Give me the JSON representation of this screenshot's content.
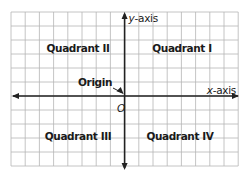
{
  "diagram": {
    "grid": {
      "columns": 16,
      "rows": 11,
      "origin_column": 8,
      "origin_row": 6
    },
    "colors": {
      "grid": "#b5b5b5",
      "axis": "#222222",
      "text": "#1a1a1a",
      "background": "#ffffff"
    },
    "axes": {
      "x": {
        "label_var": "x",
        "label_suffix": "-axis"
      },
      "y": {
        "label_var": "y",
        "label_suffix": "-axis"
      }
    },
    "origin": {
      "label": "Origin",
      "symbol": "O"
    },
    "quadrants": [
      {
        "id": "I",
        "label": "Quadrant I"
      },
      {
        "id": "II",
        "label": "Quadrant II"
      },
      {
        "id": "III",
        "label": "Quadrant III"
      },
      {
        "id": "IV",
        "label": "Quadrant IV"
      }
    ]
  }
}
